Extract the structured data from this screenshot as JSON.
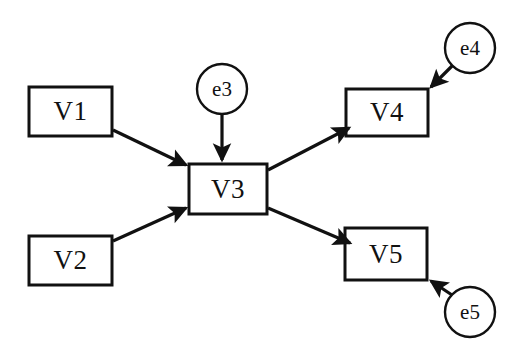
{
  "diagram": {
    "type": "path-diagram",
    "title": "",
    "background_color": "#ffffff",
    "stroke_color": "#111111",
    "fill_color": "#ffffff",
    "observed_variables": [
      {
        "id": "V1",
        "label": "V1",
        "shape": "rectangle",
        "x": 29,
        "y": 87,
        "width": 83,
        "height": 49
      },
      {
        "id": "V2",
        "label": "V2",
        "shape": "rectangle",
        "x": 29,
        "y": 236,
        "width": 83,
        "height": 49
      },
      {
        "id": "V3",
        "label": "V3",
        "shape": "rectangle",
        "x": 189,
        "y": 164,
        "width": 78,
        "height": 50
      },
      {
        "id": "V4",
        "label": "V4",
        "shape": "rectangle",
        "x": 346,
        "y": 89,
        "width": 82,
        "height": 47
      },
      {
        "id": "V5",
        "label": "V5",
        "shape": "rectangle",
        "x": 345,
        "y": 228,
        "width": 82,
        "height": 52
      }
    ],
    "error_terms": [
      {
        "id": "e3",
        "label": "e3",
        "shape": "circle",
        "cx": 222,
        "cy": 89,
        "r": 25
      },
      {
        "id": "e4",
        "label": "e4",
        "shape": "circle",
        "cx": 470,
        "cy": 48,
        "r": 25
      },
      {
        "id": "e5",
        "label": "e5",
        "shape": "circle",
        "cx": 470,
        "cy": 312,
        "r": 25
      }
    ],
    "arrows": [
      {
        "id": "V1-to-V3",
        "from": "V1",
        "to": "V3",
        "x1": 113,
        "y1": 130,
        "x2": 190,
        "y2": 168
      },
      {
        "id": "V2-to-V3",
        "from": "V2",
        "to": "V3",
        "x1": 113,
        "y1": 241,
        "x2": 190,
        "y2": 205
      },
      {
        "id": "e3-to-V3",
        "from": "e3",
        "to": "V3",
        "x1": 222,
        "y1": 114,
        "x2": 222,
        "y2": 163
      },
      {
        "id": "V3-to-V4",
        "from": "V3",
        "to": "V4",
        "x1": 268,
        "y1": 170,
        "x2": 345,
        "y2": 126
      },
      {
        "id": "V3-to-V5",
        "from": "V3",
        "to": "V5",
        "x1": 268,
        "y1": 208,
        "x2": 346,
        "y2": 241
      },
      {
        "id": "e4-to-V4",
        "from": "e4",
        "to": "V4",
        "x1": 452,
        "y1": 66,
        "x2": 429,
        "y2": 89
      },
      {
        "id": "e5-to-V5",
        "from": "e5",
        "to": "V5",
        "x1": 452,
        "y1": 295,
        "x2": 428,
        "y2": 279
      }
    ]
  }
}
